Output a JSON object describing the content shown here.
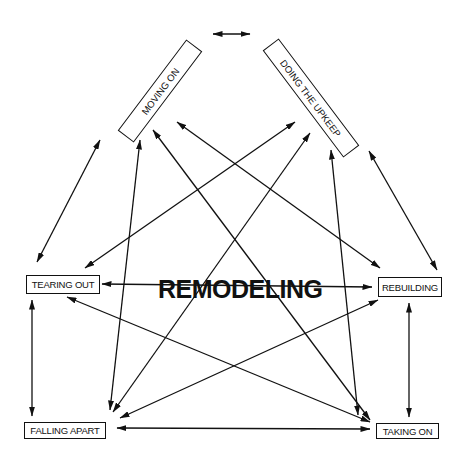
{
  "title": "REMODELING",
  "nodes": {
    "moving_on": "MOVING ON",
    "doing_upkeep": "DOING THE UPKEEP",
    "tearing_out": "TEARING OUT",
    "rebuilding": "REBUILDING",
    "falling_apart": "FALLING APART",
    "taking_on": "TAKING ON"
  },
  "edges": [
    {
      "from": "moving_on",
      "to": "doing_upkeep",
      "direction": "both"
    },
    {
      "from": "moving_on",
      "to": "tearing_out",
      "direction": "both"
    },
    {
      "from": "doing_upkeep",
      "to": "rebuilding",
      "direction": "both"
    },
    {
      "from": "tearing_out",
      "to": "falling_apart",
      "direction": "both"
    },
    {
      "from": "rebuilding",
      "to": "taking_on",
      "direction": "both"
    },
    {
      "from": "falling_apart",
      "to": "taking_on",
      "direction": "both"
    },
    {
      "from": "tearing_out",
      "to": "rebuilding",
      "direction": "both"
    },
    {
      "from": "moving_on",
      "to": "falling_apart",
      "direction": "both"
    },
    {
      "from": "moving_on",
      "to": "taking_on",
      "direction": "both"
    },
    {
      "from": "moving_on",
      "to": "rebuilding",
      "direction": "both"
    },
    {
      "from": "doing_upkeep",
      "to": "tearing_out",
      "direction": "both"
    },
    {
      "from": "doing_upkeep",
      "to": "falling_apart",
      "direction": "both"
    },
    {
      "from": "doing_upkeep",
      "to": "taking_on",
      "direction": "both"
    },
    {
      "from": "tearing_out",
      "to": "taking_on",
      "direction": "both"
    },
    {
      "from": "rebuilding",
      "to": "falling_apart",
      "direction": "both"
    }
  ]
}
